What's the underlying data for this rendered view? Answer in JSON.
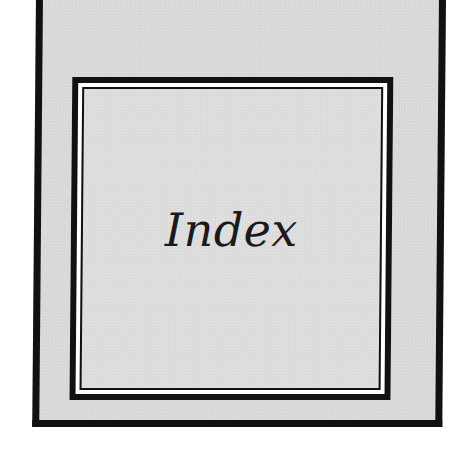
{
  "page": {
    "title": "Index"
  },
  "colors": {
    "paper": "#d8d8d8",
    "inner_panel": "#dcdcdc",
    "border": "#111111",
    "text": "#1a1a1a",
    "background": "#ffffff"
  }
}
